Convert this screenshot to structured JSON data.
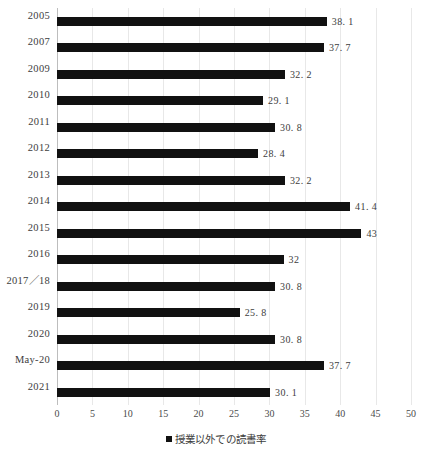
{
  "chart_data": {
    "type": "bar",
    "orientation": "horizontal",
    "title": "",
    "xlabel": "",
    "ylabel": "",
    "xlim": [
      0,
      50
    ],
    "grid": true,
    "legend_position": "bottom",
    "legend": [
      "授業以外での読書率"
    ],
    "xticks": [
      0,
      5,
      10,
      15,
      20,
      25,
      30,
      35,
      40,
      45,
      50
    ],
    "xtick_labels": [
      "0",
      "5",
      "10",
      "15",
      "20",
      "25",
      "30",
      "35",
      "40",
      "45",
      "50"
    ],
    "categories": [
      "2005",
      "2007",
      "2009",
      "2010",
      "2011",
      "2012",
      "2013",
      "2014",
      "2015",
      "2016",
      "2017／18",
      "2019",
      "2020",
      "May-20",
      "2021"
    ],
    "values": [
      38.1,
      37.7,
      32.2,
      29.1,
      30.8,
      28.4,
      32.2,
      41.4,
      43,
      32,
      30.8,
      25.8,
      30.8,
      37.7,
      30.1
    ],
    "value_labels": [
      "38. 1",
      "37. 7",
      "32. 2",
      "29. 1",
      "30. 8",
      "28. 4",
      "32. 2",
      "41. 4",
      "43",
      "32",
      "30. 8",
      "25. 8",
      "30. 8",
      "37. 7",
      "30. 1"
    ],
    "series": [
      {
        "name": "授業以外での読書率",
        "color": "#111111",
        "values": [
          38.1,
          37.7,
          32.2,
          29.1,
          30.8,
          28.4,
          32.2,
          41.4,
          43,
          32,
          30.8,
          25.8,
          30.8,
          37.7,
          30.1
        ]
      }
    ]
  },
  "legend": {
    "marker": "square-marker-icon",
    "label": "授業以外での読書率"
  },
  "colors": {
    "bar": "#111111",
    "grid": "#e8e8e8",
    "axis": "#bdbdbd",
    "text": "#3d3d3d",
    "background": "#ffffff"
  }
}
